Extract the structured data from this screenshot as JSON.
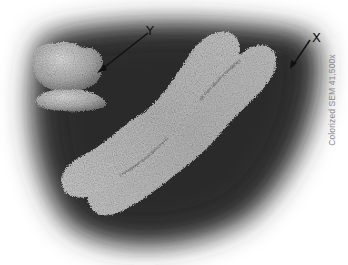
{
  "figure": {
    "labels": {
      "y": "Y",
      "x": "X"
    },
    "caption": "Colorized SEM 41,500x",
    "colors": {
      "background": "#ffffff",
      "substrate_dark": "#2e2e2e",
      "chromosome_light": "#d9d9d9",
      "chromosome_mid": "#9a9a9a",
      "label_text": "#111111",
      "caption_text": "#8a8a8a"
    }
  }
}
